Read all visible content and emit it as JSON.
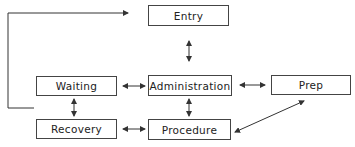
{
  "diagram": {
    "nodes": [
      {
        "id": "entry",
        "label": "Entry"
      },
      {
        "id": "waiting",
        "label": "Waiting"
      },
      {
        "id": "administration",
        "label": "Administration"
      },
      {
        "id": "prep",
        "label": "Prep"
      },
      {
        "id": "recovery",
        "label": "Recovery"
      },
      {
        "id": "procedure",
        "label": "Procedure"
      }
    ],
    "edges": [
      {
        "from": "entry",
        "to": "administration",
        "type": "bidirectional"
      },
      {
        "from": "waiting",
        "to": "administration",
        "type": "bidirectional"
      },
      {
        "from": "administration",
        "to": "prep",
        "type": "bidirectional"
      },
      {
        "from": "waiting",
        "to": "recovery",
        "type": "bidirectional"
      },
      {
        "from": "administration",
        "to": "procedure",
        "type": "bidirectional"
      },
      {
        "from": "recovery",
        "to": "procedure",
        "type": "bidirectional"
      },
      {
        "from": "procedure",
        "to": "prep",
        "type": "bidirectional"
      },
      {
        "from": "recovery",
        "to": "entry",
        "type": "directed-loop"
      }
    ],
    "colors": {
      "stroke": "#333333",
      "box_border": "#444444",
      "text": "#222222"
    }
  }
}
